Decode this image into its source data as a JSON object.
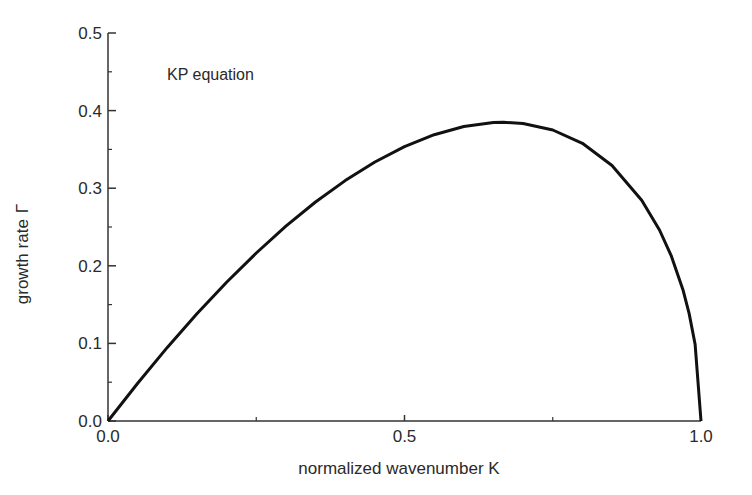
{
  "chart_data": {
    "type": "line",
    "title": "",
    "annotation": "KP equation",
    "xlabel": "normalized wavenumber K",
    "ylabel": "growth rate",
    "ylabel_symbol": "Γ",
    "xlim": [
      0.0,
      1.0
    ],
    "ylim": [
      0.0,
      0.5
    ],
    "x_ticks": [
      "0.0",
      "0.5",
      "1.0"
    ],
    "x_minor_ticks": [
      0.25,
      0.75
    ],
    "y_ticks": [
      "0.0",
      "0.1",
      "0.2",
      "0.3",
      "0.4",
      "0.5"
    ],
    "y_minor_ticks": [
      0.05,
      0.15,
      0.25,
      0.35,
      0.45
    ],
    "grid": false,
    "legend": null,
    "series": [
      {
        "name": "KP equation",
        "color": "#111111",
        "x": [
          0.0,
          0.05,
          0.1,
          0.15,
          0.2,
          0.25,
          0.3,
          0.35,
          0.4,
          0.45,
          0.5,
          0.55,
          0.6,
          0.65,
          0.6667,
          0.7,
          0.75,
          0.8,
          0.85,
          0.9,
          0.93,
          0.95,
          0.97,
          0.98,
          0.99,
          1.0
        ],
        "y": [
          0.0,
          0.0487,
          0.0949,
          0.1383,
          0.1789,
          0.2165,
          0.251,
          0.2822,
          0.3098,
          0.3337,
          0.3536,
          0.3689,
          0.3795,
          0.3845,
          0.3849,
          0.3834,
          0.375,
          0.3578,
          0.3292,
          0.2846,
          0.2461,
          0.2124,
          0.168,
          0.1386,
          0.099,
          0.0
        ]
      }
    ]
  }
}
